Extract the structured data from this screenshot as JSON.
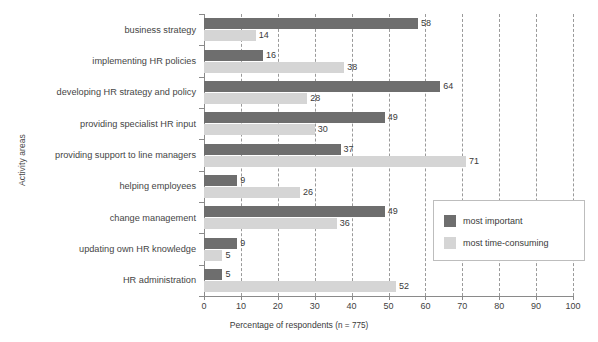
{
  "chart_data": {
    "type": "bar",
    "orientation": "horizontal",
    "title": "",
    "xlabel": "Percentage of respondents (n = 775)",
    "ylabel": "Activity areas",
    "xlim": [
      0,
      100
    ],
    "xticks": [
      0,
      10,
      20,
      30,
      40,
      50,
      60,
      70,
      80,
      90,
      100
    ],
    "grid": true,
    "grid_style": "dashed vertical",
    "legend_position": "middle right",
    "categories": [
      "business strategy",
      "implementing HR policies",
      "developing HR strategy and policy",
      "providing specialist HR input",
      "providing support to line managers",
      "helping employees",
      "change management",
      "updating own HR knowledge",
      "HR administration"
    ],
    "series": [
      {
        "name": "most important",
        "color": "#6e6e6e",
        "values": [
          58,
          16,
          64,
          49,
          37,
          9,
          49,
          9,
          5
        ]
      },
      {
        "name": "most time-consuming",
        "color": "#d5d5d5",
        "values": [
          14,
          38,
          28,
          30,
          71,
          26,
          36,
          5,
          52
        ]
      }
    ]
  },
  "axis": {
    "x_title_main": "Percentage of respondents ",
    "x_title_sub": "(n = 775)"
  }
}
